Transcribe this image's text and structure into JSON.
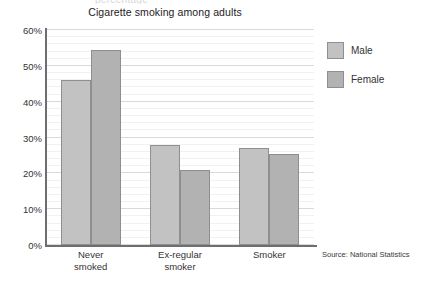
{
  "clipped_top_text": "percentage",
  "source_note": "Source: National Statistics",
  "legend": {
    "position": "right",
    "entries": [
      {
        "label": "Male",
        "color": "#c2c2c2"
      },
      {
        "label": "Female",
        "color": "#b2b2b2"
      }
    ]
  },
  "chart_data": {
    "type": "bar",
    "title": "Cigarette smoking among adults",
    "xlabel": "",
    "ylabel": "",
    "categories": [
      "Never smoked",
      "Ex-regular smoker",
      "Smoker"
    ],
    "category_lines": [
      [
        "Never",
        "smoked"
      ],
      [
        "Ex-regular",
        "smoker"
      ],
      [
        "Smoker"
      ]
    ],
    "series": [
      {
        "name": "Male",
        "color": "#c2c2c2",
        "values": [
          46,
          28,
          27
        ]
      },
      {
        "name": "Female",
        "color": "#b2b2b2",
        "values": [
          54.5,
          21,
          25.5
        ]
      }
    ],
    "ylim": [
      0,
      60
    ],
    "ytick_step": 10,
    "yticks": [
      0,
      10,
      20,
      30,
      40,
      50,
      60
    ],
    "ytick_labels": [
      "0%",
      "10%",
      "20%",
      "30%",
      "40%",
      "50%",
      "60%"
    ],
    "minor_gridline_step": 2,
    "grid": true,
    "legend_position": "right"
  }
}
